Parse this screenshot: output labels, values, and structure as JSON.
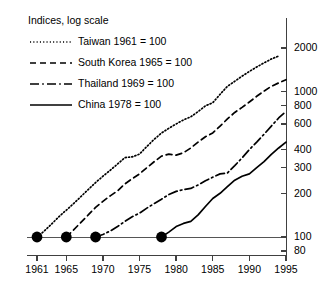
{
  "chart_data": {
    "type": "line",
    "title": "",
    "subtitle": "",
    "legend_title": "Indices, log scale",
    "legend_position": "top-left",
    "xlabel": "",
    "ylabel": "",
    "yscale": "log",
    "grid": false,
    "xlim": [
      1961,
      1995
    ],
    "ylim": [
      80,
      2400
    ],
    "xticks": [
      1961,
      1965,
      1970,
      1975,
      1980,
      1985,
      1990,
      1995
    ],
    "xtick_labels": [
      "1961",
      "1965",
      "1970",
      "1975",
      "1980",
      "1985",
      "1990",
      "1995"
    ],
    "yticks": [
      80,
      100,
      200,
      300,
      400,
      600,
      800,
      1000,
      2000
    ],
    "ytick_labels": [
      "80",
      "100",
      "200",
      "300",
      "400",
      "600",
      "800",
      "1000",
      "2000"
    ],
    "annotations": [
      {
        "name": "baseline-marker",
        "label": "Taiwan base year",
        "x": 1961,
        "y": 100
      },
      {
        "name": "baseline-marker",
        "label": "South Korea base year",
        "x": 1965,
        "y": 100
      },
      {
        "name": "baseline-marker",
        "label": "Thailand base year",
        "x": 1969,
        "y": 100
      },
      {
        "name": "baseline-marker",
        "label": "China base year",
        "x": 1978,
        "y": 100
      }
    ],
    "series": [
      {
        "name": "Taiwan 1961 = 100",
        "legend_label": "Taiwan 1961 = 100",
        "dash": "dotted",
        "base_year": 1961,
        "x": [
          1961,
          1962,
          1963,
          1964,
          1965,
          1966,
          1967,
          1968,
          1969,
          1970,
          1971,
          1972,
          1973,
          1974,
          1975,
          1976,
          1977,
          1978,
          1979,
          1980,
          1981,
          1982,
          1983,
          1984,
          1985,
          1986,
          1987,
          1988,
          1989,
          1990,
          1991,
          1992,
          1993,
          1994
        ],
        "values": [
          100,
          110,
          123,
          138,
          153,
          170,
          190,
          212,
          237,
          262,
          288,
          318,
          352,
          356,
          372,
          420,
          470,
          520,
          560,
          600,
          640,
          672,
          730,
          800,
          840,
          960,
          1090,
          1180,
          1280,
          1380,
          1480,
          1580,
          1680,
          1760
        ]
      },
      {
        "name": "South Korea 1965 = 100",
        "legend_label": "South Korea 1965 = 100",
        "dash": "dashed",
        "base_year": 1965,
        "x": [
          1965,
          1966,
          1967,
          1968,
          1969,
          1970,
          1971,
          1972,
          1973,
          1974,
          1975,
          1976,
          1977,
          1978,
          1979,
          1980,
          1981,
          1982,
          1983,
          1984,
          1985,
          1986,
          1987,
          1988,
          1989,
          1990,
          1991,
          1992,
          1993,
          1994,
          1995
        ],
        "values": [
          100,
          112,
          126,
          142,
          160,
          176,
          192,
          208,
          232,
          252,
          272,
          300,
          330,
          360,
          372,
          366,
          380,
          410,
          450,
          490,
          520,
          580,
          650,
          720,
          780,
          850,
          930,
          1010,
          1090,
          1150,
          1210
        ]
      },
      {
        "name": "Thailand 1969 = 100",
        "legend_label": "Thailand 1969 = 100",
        "dash": "dashdot",
        "base_year": 1969,
        "x": [
          1969,
          1970,
          1971,
          1972,
          1973,
          1974,
          1975,
          1976,
          1977,
          1978,
          1979,
          1980,
          1981,
          1982,
          1983,
          1984,
          1985,
          1986,
          1987,
          1988,
          1989,
          1990,
          1991,
          1992,
          1993,
          1994,
          1995
        ],
        "values": [
          100,
          104,
          110,
          118,
          128,
          138,
          146,
          158,
          170,
          182,
          196,
          206,
          212,
          216,
          228,
          244,
          258,
          272,
          276,
          310,
          350,
          400,
          450,
          510,
          580,
          660,
          730
        ]
      },
      {
        "name": "China 1978 = 100",
        "legend_label": "China 1978 = 100",
        "dash": "solid",
        "base_year": 1978,
        "x": [
          1978,
          1979,
          1980,
          1981,
          1982,
          1983,
          1984,
          1985,
          1986,
          1987,
          1988,
          1989,
          1990,
          1991,
          1992,
          1993,
          1994,
          1995
        ],
        "values": [
          100,
          108,
          118,
          124,
          128,
          142,
          162,
          184,
          200,
          222,
          246,
          262,
          272,
          300,
          330,
          370,
          410,
          450
        ]
      }
    ]
  }
}
